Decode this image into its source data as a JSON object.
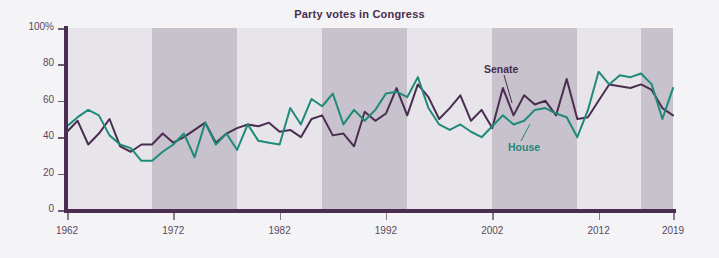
{
  "figure": {
    "title": "Party votes in Congress",
    "width": 719,
    "height": 258,
    "background": "#f4f3f5"
  },
  "colors": {
    "senate_line": "#4a2d50",
    "house_line": "#1f8a7a",
    "axis": "#4a2d50",
    "band_light": "#e7e5ea",
    "band_dark": "#c7c2cb",
    "tick_text": "#5a4a60",
    "title_text": "#4a2d50"
  },
  "annotations": {
    "senate_label": "Senate",
    "house_label": "House"
  },
  "axes": {
    "y_tick_labels": [
      "100%",
      "80",
      "60",
      "40",
      "20",
      "0"
    ],
    "y_tick_values": [
      100,
      80,
      60,
      40,
      20,
      0
    ],
    "x_tick_labels": [
      "1962",
      "1972",
      "1982",
      "1992",
      "2002",
      "2012",
      "2019"
    ],
    "x_tick_values": [
      1962,
      1972,
      1982,
      1992,
      2002,
      2012,
      2019
    ]
  },
  "chart_data": {
    "type": "line",
    "title": "Party votes in Congress",
    "xlabel": "",
    "ylabel": "",
    "xlim": [
      1962,
      2019
    ],
    "ylim": [
      0,
      100
    ],
    "grid": false,
    "legend_position": "inline-annotation",
    "bands": {
      "description": "Alternating vertical shading by congressional term (2-year blocks grouped into ~4-year alternating bands)",
      "light_color": "#e7e5ea",
      "dark_color": "#c7c2cb",
      "ranges": [
        {
          "start": 1962,
          "end": 1970,
          "shade": "light"
        },
        {
          "start": 1970,
          "end": 1978,
          "shade": "dark"
        },
        {
          "start": 1978,
          "end": 1986,
          "shade": "light"
        },
        {
          "start": 1986,
          "end": 1994,
          "shade": "dark"
        },
        {
          "start": 1994,
          "end": 2002,
          "shade": "light"
        },
        {
          "start": 2002,
          "end": 2010,
          "shade": "dark"
        },
        {
          "start": 2010,
          "end": 2016,
          "shade": "light"
        },
        {
          "start": 2016,
          "end": 2019,
          "shade": "dark"
        }
      ]
    },
    "x": [
      1962,
      1963,
      1964,
      1965,
      1966,
      1967,
      1968,
      1969,
      1970,
      1971,
      1972,
      1973,
      1974,
      1975,
      1976,
      1977,
      1978,
      1979,
      1980,
      1981,
      1982,
      1983,
      1984,
      1985,
      1986,
      1987,
      1988,
      1989,
      1990,
      1991,
      1992,
      1993,
      1994,
      1995,
      1996,
      1997,
      1998,
      1999,
      2000,
      2001,
      2002,
      2003,
      2004,
      2005,
      2006,
      2007,
      2008,
      2009,
      2010,
      2011,
      2012,
      2013,
      2014,
      2015,
      2016,
      2017,
      2018,
      2019
    ],
    "series": [
      {
        "name": "Senate",
        "color": "#4a2d50",
        "values": [
          43,
          49,
          36,
          42,
          50,
          35,
          32,
          36,
          36,
          42,
          37,
          40,
          44,
          48,
          37,
          42,
          45,
          47,
          46,
          48,
          43,
          44,
          40,
          50,
          52,
          41,
          42,
          35,
          54,
          49,
          53,
          67,
          52,
          69,
          62,
          50,
          56,
          63,
          49,
          55,
          45,
          67,
          52,
          63,
          58,
          60,
          52,
          72,
          50,
          51,
          60,
          69,
          68,
          67,
          69,
          66,
          56,
          52
        ]
      },
      {
        "name": "House",
        "color": "#1f8a7a",
        "values": [
          46,
          51,
          55,
          52,
          41,
          36,
          34,
          27,
          27,
          32,
          36,
          42,
          29,
          48,
          36,
          42,
          33,
          47,
          38,
          37,
          36,
          56,
          47,
          61,
          57,
          64,
          47,
          55,
          49,
          55,
          64,
          65,
          62,
          73,
          56,
          47,
          44,
          47,
          43,
          40,
          46,
          52,
          47,
          49,
          55,
          56,
          53,
          51,
          40,
          55,
          76,
          69,
          74,
          73,
          75,
          69,
          50,
          67
        ]
      }
    ]
  }
}
